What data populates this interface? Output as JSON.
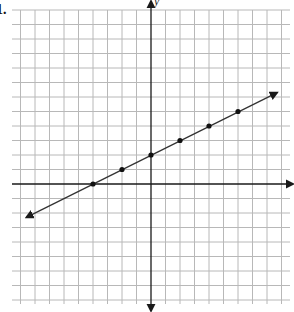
{
  "question": {
    "number_label": "1."
  },
  "axes": {
    "x_label": "x",
    "y_label": "y"
  },
  "colors": {
    "grid": "#b8b8b8",
    "axis": "#1a1a1a",
    "line": "#333333",
    "point": "#111111",
    "background": "#ffffff"
  },
  "chart_data": {
    "type": "line",
    "title": "",
    "xlabel": "x",
    "ylabel": "y",
    "xlim": [
      -9,
      9
    ],
    "ylim": [
      -8,
      12
    ],
    "grid": true,
    "unit_px": 14.5,
    "origin_px": [
      151,
      184
    ],
    "line": {
      "slope": 0.5,
      "intercept": 2,
      "equation": "y = 0.5x + 2",
      "arrows_both_ends": true,
      "from": [
        -8.6,
        -2.3
      ],
      "to": [
        8.7,
        6.3
      ]
    },
    "points": [
      {
        "x": -4,
        "y": 0
      },
      {
        "x": -2,
        "y": 1
      },
      {
        "x": 0,
        "y": 2
      },
      {
        "x": 2,
        "y": 3
      },
      {
        "x": 4,
        "y": 4
      },
      {
        "x": 6,
        "y": 5
      }
    ]
  }
}
